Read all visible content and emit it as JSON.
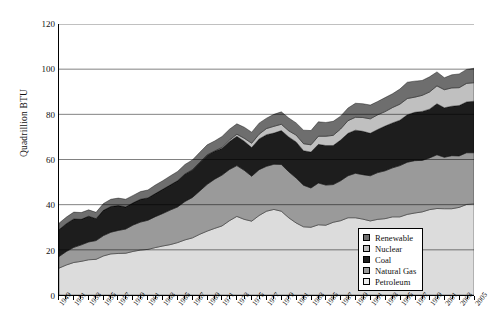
{
  "chart_data": {
    "type": "area",
    "stacked": true,
    "title": "",
    "xlabel": "",
    "ylabel": "Quadrillion BTU",
    "ylim": [
      0,
      120
    ],
    "yticks": [
      0,
      20,
      40,
      60,
      80,
      100,
      120
    ],
    "grid": true,
    "grid_axis": "y",
    "legend_position": "bottom-right",
    "x": [
      1949,
      1950,
      1951,
      1952,
      1953,
      1954,
      1955,
      1956,
      1957,
      1958,
      1959,
      1960,
      1961,
      1962,
      1963,
      1964,
      1965,
      1966,
      1967,
      1968,
      1969,
      1970,
      1971,
      1972,
      1973,
      1974,
      1975,
      1976,
      1977,
      1978,
      1979,
      1980,
      1981,
      1982,
      1983,
      1984,
      1985,
      1986,
      1987,
      1988,
      1989,
      1990,
      1991,
      1992,
      1993,
      1994,
      1995,
      1996,
      1997,
      1998,
      1999,
      2000,
      2001,
      2002,
      2003,
      2004,
      2005
    ],
    "tick_labels": [
      "1949",
      "1951",
      "1953",
      "1955",
      "1957",
      "1959",
      "1961",
      "1963",
      "1965",
      "1967",
      "1969",
      "1971",
      "1973",
      "1975",
      "1977",
      "1979",
      "1981",
      "1983",
      "1985",
      "1987",
      "1989",
      "1991",
      "1993",
      "1995",
      "1997",
      "1999",
      "2001",
      "2003",
      "2005"
    ],
    "series": [
      {
        "name": "Petroleum",
        "color": "#dcdcdc",
        "values": [
          11.9,
          13.3,
          14.4,
          14.9,
          15.6,
          15.8,
          17.3,
          18.2,
          18.4,
          18.5,
          19.3,
          19.9,
          20.2,
          21.0,
          21.7,
          22.3,
          23.2,
          24.4,
          25.3,
          26.9,
          28.3,
          29.5,
          30.6,
          32.9,
          34.8,
          33.5,
          32.7,
          35.2,
          37.1,
          37.9,
          37.1,
          34.2,
          31.9,
          30.2,
          30.0,
          31.1,
          30.9,
          32.2,
          32.9,
          34.2,
          34.2,
          33.6,
          32.8,
          33.5,
          33.8,
          34.6,
          34.6,
          35.7,
          36.3,
          36.8,
          37.8,
          38.3,
          38.2,
          38.2,
          38.8,
          40.1,
          40.4
        ]
      },
      {
        "name": "Natural Gas",
        "color": "#9a9a9a",
        "values": [
          5.1,
          6.0,
          6.7,
          7.3,
          7.9,
          8.3,
          9.0,
          9.6,
          10.2,
          10.7,
          11.7,
          12.4,
          12.9,
          13.7,
          14.4,
          15.3,
          15.8,
          17.0,
          17.9,
          19.2,
          20.7,
          21.8,
          22.5,
          22.7,
          22.5,
          21.7,
          19.9,
          20.3,
          19.9,
          20.0,
          20.7,
          20.4,
          19.9,
          18.4,
          17.4,
          18.5,
          17.8,
          16.7,
          17.7,
          18.6,
          19.7,
          19.7,
          20.0,
          20.7,
          21.2,
          21.7,
          22.7,
          23.1,
          23.2,
          22.8,
          22.9,
          23.8,
          22.8,
          23.5,
          22.8,
          22.9,
          22.6
        ]
      },
      {
        "name": "Coal",
        "color": "#1d1d1d",
        "values": [
          11.9,
          12.3,
          12.6,
          11.3,
          11.4,
          9.7,
          11.2,
          11.4,
          11.0,
          9.8,
          9.8,
          10.1,
          9.9,
          10.2,
          10.7,
          11.1,
          11.6,
          12.1,
          12.2,
          12.6,
          12.9,
          12.3,
          11.9,
          12.4,
          13.0,
          12.9,
          12.7,
          13.6,
          14.0,
          13.8,
          15.0,
          15.4,
          16.0,
          15.3,
          15.9,
          17.1,
          17.5,
          17.3,
          18.0,
          18.8,
          19.1,
          19.2,
          18.8,
          19.1,
          19.8,
          19.9,
          20.1,
          21.0,
          21.4,
          21.7,
          21.6,
          22.6,
          21.9,
          21.9,
          22.3,
          22.5,
          22.8
        ]
      },
      {
        "name": "Nuclear",
        "color": "#c0c0c0",
        "values": [
          0.0,
          0.0,
          0.0,
          0.0,
          0.0,
          0.0,
          0.0,
          0.0,
          0.0,
          0.0,
          0.0,
          0.0,
          0.0,
          0.0,
          0.0,
          0.0,
          0.0,
          0.1,
          0.1,
          0.1,
          0.2,
          0.2,
          0.4,
          0.6,
          0.9,
          1.3,
          1.9,
          2.1,
          2.7,
          3.0,
          2.8,
          2.7,
          3.0,
          3.1,
          3.2,
          3.6,
          4.1,
          4.5,
          4.9,
          5.6,
          5.7,
          6.1,
          6.4,
          6.5,
          6.4,
          6.8,
          7.1,
          7.2,
          6.7,
          7.1,
          7.6,
          7.9,
          8.0,
          8.1,
          7.9,
          8.2,
          8.2
        ]
      },
      {
        "name": "Renewable",
        "color": "#6e6e6e",
        "values": [
          2.9,
          2.9,
          3.0,
          3.0,
          2.8,
          2.8,
          3.0,
          3.2,
          3.3,
          3.4,
          3.3,
          3.4,
          3.5,
          3.8,
          3.8,
          4.0,
          4.1,
          4.2,
          4.3,
          4.4,
          4.4,
          4.4,
          4.8,
          4.8,
          4.6,
          4.9,
          4.9,
          4.9,
          4.6,
          5.3,
          5.5,
          5.7,
          5.4,
          6.0,
          6.3,
          6.4,
          6.1,
          6.2,
          5.7,
          5.6,
          6.2,
          6.1,
          6.1,
          5.9,
          6.2,
          6.1,
          6.7,
          7.2,
          7.1,
          6.6,
          6.7,
          6.2,
          5.3,
          5.8,
          6.1,
          6.2,
          6.4
        ]
      }
    ]
  },
  "legend": {
    "items": [
      {
        "label": "Renewable",
        "color": "#6e6e6e"
      },
      {
        "label": "Nuclear",
        "color": "#c0c0c0"
      },
      {
        "label": "Coal",
        "color": "#1d1d1d"
      },
      {
        "label": "Natural Gas",
        "color": "#9a9a9a"
      },
      {
        "label": "Petroleum",
        "color": "#ededed"
      }
    ]
  }
}
